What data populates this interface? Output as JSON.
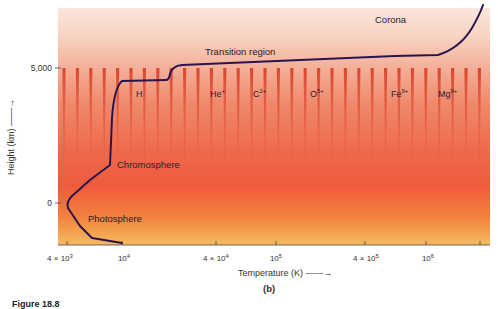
{
  "chart_data": {
    "type": "line",
    "title": "",
    "panel_label": "(b)",
    "xlabel": "Temperature (K) →",
    "ylabel": "Height (km) →",
    "xscale": "log",
    "x_ticks": [
      {
        "value": 4000,
        "label": "4 × 10³"
      },
      {
        "value": 10000,
        "label": "10⁴"
      },
      {
        "value": 40000,
        "label": "4 × 10⁴"
      },
      {
        "value": 100000,
        "label": "10⁵"
      },
      {
        "value": 400000,
        "label": "4 × 10⁵"
      },
      {
        "value": 1000000,
        "label": "10⁶"
      },
      {
        "value": 2000000,
        "label": ""
      }
    ],
    "y_ticks": [
      {
        "value": 0,
        "label": "0"
      },
      {
        "value": 5000,
        "label": "5,000"
      }
    ],
    "xlim": [
      3500,
      2500000
    ],
    "ylim": [
      -1500,
      7000
    ],
    "series": [
      {
        "name": "Temperature profile",
        "color": "#2a1450",
        "points": [
          {
            "T": 10000,
            "h": -1450
          },
          {
            "T": 6500,
            "h": -1250
          },
          {
            "T": 4400,
            "h": 0
          },
          {
            "T": 5500,
            "h": 500
          },
          {
            "T": 8000,
            "h": 1400
          },
          {
            "T": 8500,
            "h": 3000
          },
          {
            "T": 9000,
            "h": 4300
          },
          {
            "T": 10500,
            "h": 4550
          },
          {
            "T": 25000,
            "h": 4550
          },
          {
            "T": 27000,
            "h": 5000
          },
          {
            "T": 40000,
            "h": 5150
          },
          {
            "T": 500000,
            "h": 5500
          },
          {
            "T": 900000,
            "h": 5550
          },
          {
            "T": 1600000,
            "h": 6500
          },
          {
            "T": 2000000,
            "h": 7200
          }
        ]
      }
    ],
    "annotations": [
      {
        "text": "Corona",
        "region": "top-right"
      },
      {
        "text": "Transition region",
        "region": "upper-middle"
      },
      {
        "text": "Chromosphere",
        "region": "left-middle"
      },
      {
        "text": "Photosphere",
        "region": "bottom-left"
      },
      {
        "text": "H",
        "sup": ""
      },
      {
        "text": "He",
        "sup": "+"
      },
      {
        "text": "C",
        "sup": "2+"
      },
      {
        "text": "O",
        "sup": "5+"
      },
      {
        "text": "Fe",
        "sup": "9+"
      },
      {
        "text": "Mg",
        "sup": "9+"
      }
    ],
    "grid": false,
    "legend": "none"
  },
  "regions": {
    "corona": "Corona",
    "transition": "Transition region",
    "chromosphere": "Chromosphere",
    "photosphere": "Photosphere"
  },
  "ions": [
    {
      "base": "H",
      "sup": ""
    },
    {
      "base": "He",
      "sup": "+"
    },
    {
      "base": "C",
      "sup": "2+"
    },
    {
      "base": "O",
      "sup": "5+"
    },
    {
      "base": "Fe",
      "sup": "9+"
    },
    {
      "base": "Mg",
      "sup": "9+"
    }
  ],
  "axes": {
    "xlabel": "Temperature (K) ——→",
    "ylabel": "Height (km) ——→",
    "panel": "(b)",
    "y_ticks": [
      "5,000",
      "0"
    ],
    "x_ticks": [
      {
        "base": "4 × 10",
        "exp": "3"
      },
      {
        "base": "10",
        "exp": "4"
      },
      {
        "base": "4 × 10",
        "exp": "4"
      },
      {
        "base": "10",
        "exp": "5"
      },
      {
        "base": "4 × 10",
        "exp": "5"
      },
      {
        "base": "10",
        "exp": "6"
      }
    ]
  },
  "caption": "Figure 18.8",
  "colors": {
    "curve": "#2a1450",
    "top": "#f7d2c2",
    "middle": "#ef5a3c",
    "bottom": "#f6b860",
    "spike": "#e0402a"
  }
}
